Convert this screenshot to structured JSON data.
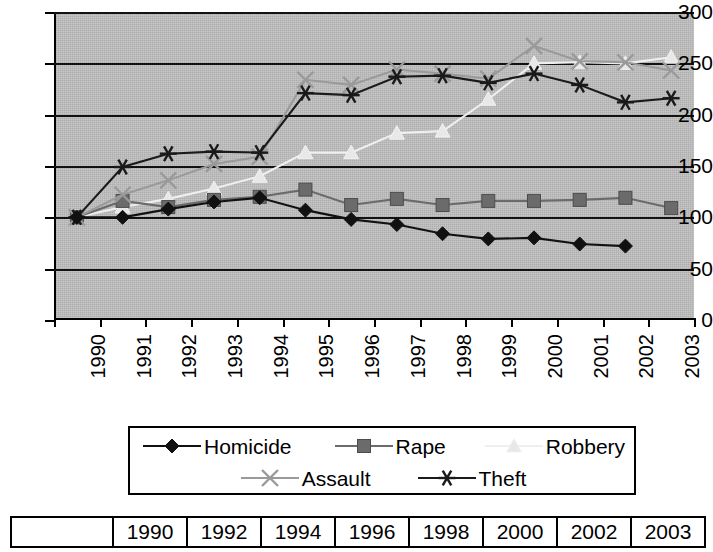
{
  "chart_data": {
    "type": "line",
    "title": "",
    "xlabel": "",
    "ylabel": "",
    "ylim": [
      0,
      300
    ],
    "ytick_values": [
      0,
      50,
      100,
      150,
      200,
      250,
      300
    ],
    "ytick_labels": [
      "0",
      "50",
      "100",
      "150",
      "200",
      "250",
      "300"
    ],
    "grid": true,
    "legend_position": "bottom",
    "x": [
      1990,
      1991,
      1992,
      1993,
      1994,
      1995,
      1996,
      1997,
      1998,
      1999,
      2000,
      2001,
      2002,
      2003
    ],
    "categories": [
      "1990",
      "1991",
      "1992",
      "1993",
      "1994",
      "1995",
      "1996",
      "1997",
      "1998",
      "1999",
      "2000",
      "2001",
      "2002",
      "2003"
    ],
    "series": [
      {
        "name": "Homicide",
        "marker": "diamond",
        "color": "#111111",
        "values": [
          100,
          100,
          108,
          115,
          119,
          107,
          98,
          93,
          84,
          79,
          80,
          74,
          72,
          null
        ]
      },
      {
        "name": "Rape",
        "marker": "square",
        "color": "#6b6b6b",
        "values": [
          100,
          116,
          110,
          117,
          120,
          127,
          112,
          118,
          112,
          116,
          116,
          117,
          119,
          109
        ]
      },
      {
        "name": "Robbery",
        "marker": "triangle",
        "color": "#e8e8e8",
        "values": [
          100,
          110,
          118,
          128,
          140,
          163,
          163,
          182,
          184,
          215,
          250,
          251,
          250,
          256
        ]
      },
      {
        "name": "Assault",
        "marker": "x",
        "color": "#9a9a9a",
        "values": [
          100,
          122,
          136,
          152,
          159,
          234,
          229,
          244,
          240,
          235,
          267,
          252,
          251,
          243
        ]
      },
      {
        "name": "Theft",
        "marker": "asterisk",
        "color": "#1a1a1a",
        "values": [
          100,
          149,
          162,
          164,
          163,
          221,
          219,
          237,
          238,
          231,
          240,
          229,
          212,
          216
        ]
      }
    ]
  },
  "legend": {
    "items": [
      {
        "label": "Homicide",
        "marker": "diamond",
        "color": "#111111"
      },
      {
        "label": "Rape",
        "marker": "square",
        "color": "#6b6b6b"
      },
      {
        "label": "Robbery",
        "marker": "triangle",
        "color": "#e8e8e8"
      },
      {
        "label": "Assault",
        "marker": "x",
        "color": "#9a9a9a"
      },
      {
        "label": "Theft",
        "marker": "asterisk",
        "color": "#1a1a1a"
      }
    ]
  },
  "table": {
    "corner_label": "",
    "headers": [
      "1990",
      "1992",
      "1994",
      "1996",
      "1998",
      "2000",
      "2002",
      "2003"
    ]
  }
}
